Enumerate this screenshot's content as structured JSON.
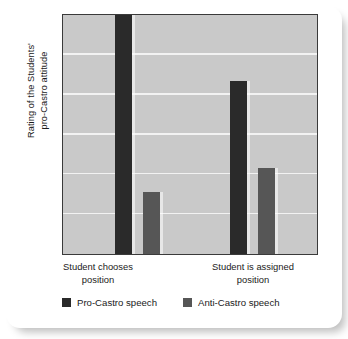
{
  "chart_data": {
    "type": "bar",
    "title": "",
    "xlabel": "",
    "ylabel": "Rating of the Students' pro-Castro attitude",
    "ylabel_lines": [
      "Rating of the Students'",
      "pro-Castro attitude"
    ],
    "categories": [
      "Student chooses position",
      "Student is assigned position"
    ],
    "category_lines": [
      [
        "Student chooses",
        "position"
      ],
      [
        "Student is assigned",
        "position"
      ]
    ],
    "series": [
      {
        "name": "Pro-Castro speech",
        "color": "#2a2a2a",
        "values": [
          6.0,
          4.35
        ]
      },
      {
        "name": "Anti-Castro speech",
        "color": "#565656",
        "values": [
          1.55,
          2.15
        ]
      }
    ],
    "ylim": [
      0,
      6
    ],
    "y_tick_values": [
      1,
      2,
      3,
      4,
      5
    ],
    "y_tick_labels": [],
    "grid": true,
    "gridline_count": 5,
    "legend_position": "bottom",
    "plot_background": "#c9c9c9",
    "gridline_color": "#f2f2f2",
    "axis_color": "#3a3a3a",
    "page_background": "#ffffff"
  },
  "legend": {
    "items": [
      {
        "label": "Pro-Castro speech",
        "color": "#2a2a2a"
      },
      {
        "label": "Anti-Castro speech",
        "color": "#565656"
      }
    ]
  }
}
